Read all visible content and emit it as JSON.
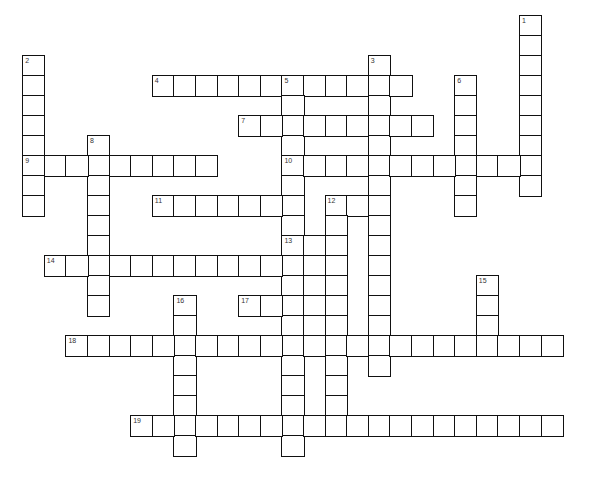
{
  "puzzle": {
    "title": "",
    "grid": {
      "origin_x": 23,
      "origin_y": 16,
      "cell_width": 21.6,
      "cell_height": 20,
      "border_color": "#111111",
      "label_color": "#333333"
    },
    "words": [
      {
        "number": "1",
        "direction": "down",
        "row": 0,
        "col": 23,
        "length": 9
      },
      {
        "number": "2",
        "direction": "down",
        "row": 2,
        "col": 0,
        "length": 8
      },
      {
        "number": "3",
        "direction": "down",
        "row": 2,
        "col": 16,
        "length": 16
      },
      {
        "number": "4",
        "direction": "across",
        "row": 3,
        "col": 6,
        "length": 12
      },
      {
        "number": "5",
        "direction": "down",
        "row": 3,
        "col": 12,
        "length": 19
      },
      {
        "number": "6",
        "direction": "down",
        "row": 3,
        "col": 20,
        "length": 7
      },
      {
        "number": "7",
        "direction": "across",
        "row": 5,
        "col": 10,
        "length": 9
      },
      {
        "number": "8",
        "direction": "down",
        "row": 6,
        "col": 3,
        "length": 9
      },
      {
        "number": "9",
        "direction": "across",
        "row": 7,
        "col": 0,
        "length": 9
      },
      {
        "number": "10",
        "direction": "across",
        "row": 7,
        "col": 12,
        "length": 12
      },
      {
        "number": "11",
        "direction": "across",
        "row": 9,
        "col": 6,
        "length": 7
      },
      {
        "number": "12",
        "direction": "across",
        "row": 9,
        "col": 14,
        "length": 3
      },
      {
        "number": "12",
        "direction": "down",
        "row": 9,
        "col": 14,
        "length": 12
      },
      {
        "number": "13",
        "direction": "across",
        "row": 11,
        "col": 12,
        "length": 3
      },
      {
        "number": "",
        "direction": "down",
        "row": 11,
        "col": 13,
        "length": 6
      },
      {
        "number": "14",
        "direction": "across",
        "row": 12,
        "col": 1,
        "length": 12
      },
      {
        "number": "15",
        "direction": "down",
        "row": 13,
        "col": 21,
        "length": 4
      },
      {
        "number": "16",
        "direction": "down",
        "row": 14,
        "col": 7,
        "length": 8
      },
      {
        "number": "17",
        "direction": "across",
        "row": 14,
        "col": 10,
        "length": 5
      },
      {
        "number": "18",
        "direction": "across",
        "row": 16,
        "col": 2,
        "length": 23
      },
      {
        "number": "19",
        "direction": "across",
        "row": 20,
        "col": 5,
        "length": 20
      }
    ]
  }
}
